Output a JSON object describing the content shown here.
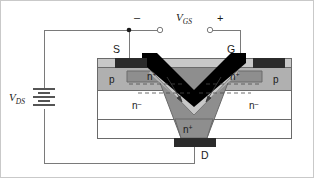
{
  "figure": {
    "kind": "vmos-transistor-cross-section",
    "background": "#ffffff",
    "border_color": "#c9c9c9"
  },
  "labels": {
    "vgs": "V",
    "vgs_sub": "GS",
    "vds": "V",
    "vds_sub": "DS",
    "minus": "–",
    "plus": "+",
    "source": "S",
    "gate": "G",
    "drain": "D",
    "p_left": "p",
    "p_right": "p",
    "nplus_left": "n",
    "nplus_left_sup": "+",
    "nplus_right": "n",
    "nplus_right_sup": "+",
    "nplus_drain": "n",
    "nplus_drain_sup": "+",
    "nminus_left": "n",
    "nminus_left_sup": "–",
    "nminus_right": "n",
    "nminus_right_sup": "–"
  },
  "colors": {
    "wire": "#7a7a7a",
    "outline": "#6a6a6a",
    "metal_contact": "#2b2b2b",
    "gate_metal": "#000000",
    "oxide": "#c8c8c8",
    "p_region": "#b0b0b0",
    "n_plus_region": "#8e8e8e",
    "n_minus_region": "#ffffff",
    "substrate": "#ffffff",
    "text": "#1a1a1a",
    "dashed": "#4a4a4a"
  },
  "geometry": {
    "note": "coordinates in a 314x178 viewBox",
    "device_left": 96,
    "device_right": 290,
    "device_top": 57,
    "device_bottom": 137,
    "groove_apex_x": 193,
    "groove_apex_y": 103
  },
  "annotations": {
    "current_arrows": 2,
    "channel_dashes": 4
  }
}
